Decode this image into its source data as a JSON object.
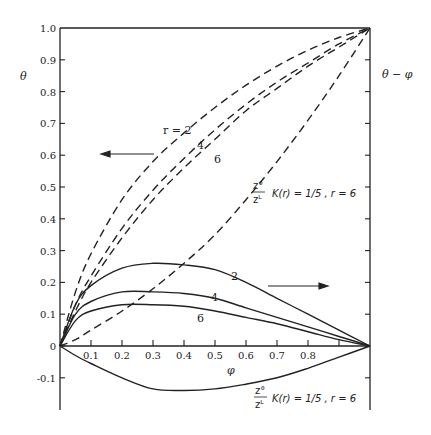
{
  "chart_data": {
    "type": "line",
    "title": "",
    "xlabel": "φ",
    "ylabel_left": "θ",
    "ylabel_right": "θ − φ",
    "xlim": [
      0,
      1.0
    ],
    "ylim_left": [
      -0.2,
      1.0
    ],
    "ylim_right": [
      -0.2,
      1.0
    ],
    "grid": false,
    "x_ticks": [
      "0.1",
      "0.2",
      "0.3",
      "0.4",
      "0.5",
      "0.6",
      "0.7",
      "0.8"
    ],
    "y_ticks": [
      "1.0",
      "0.9",
      "0.8",
      "0.7",
      "0.6",
      "0.5",
      "0.4",
      "0.3",
      "0.2",
      "0.1",
      "0",
      "-0.1"
    ],
    "x": [
      0,
      0.05,
      0.1,
      0.2,
      0.3,
      0.4,
      0.5,
      0.6,
      0.7,
      0.8,
      0.9,
      1.0
    ],
    "series": [
      {
        "name": "θ, r = 2",
        "axis": "left",
        "style": "dashed",
        "values": [
          0,
          0.17,
          0.29,
          0.46,
          0.58,
          0.67,
          0.75,
          0.82,
          0.88,
          0.93,
          0.97,
          1.0
        ]
      },
      {
        "name": "θ, r = 4",
        "axis": "left",
        "style": "dashed",
        "values": [
          0,
          0.13,
          0.22,
          0.37,
          0.49,
          0.59,
          0.68,
          0.76,
          0.83,
          0.89,
          0.95,
          1.0
        ]
      },
      {
        "name": "θ, r = 6",
        "axis": "left",
        "style": "dashed",
        "values": [
          0,
          0.11,
          0.2,
          0.34,
          0.46,
          0.56,
          0.65,
          0.74,
          0.81,
          0.88,
          0.94,
          1.0
        ]
      },
      {
        "name": "θ, (z°/zᴸ) K(r) = 1/5, r = 6",
        "axis": "left",
        "style": "dashed",
        "values": [
          0,
          0.02,
          0.05,
          0.11,
          0.18,
          0.26,
          0.35,
          0.46,
          0.58,
          0.71,
          0.85,
          1.0
        ]
      },
      {
        "name": "θ − φ, r = 2",
        "axis": "right",
        "style": "solid",
        "values": [
          0,
          0.13,
          0.19,
          0.245,
          0.26,
          0.255,
          0.24,
          0.2,
          0.15,
          0.1,
          0.05,
          0
        ]
      },
      {
        "name": "θ − φ, r = 4",
        "axis": "right",
        "style": "solid",
        "values": [
          0,
          0.1,
          0.14,
          0.17,
          0.17,
          0.165,
          0.15,
          0.12,
          0.09,
          0.06,
          0.03,
          0
        ]
      },
      {
        "name": "θ − φ, r = 6",
        "axis": "right",
        "style": "solid",
        "values": [
          0,
          0.08,
          0.11,
          0.13,
          0.13,
          0.125,
          0.11,
          0.09,
          0.07,
          0.045,
          0.02,
          0
        ]
      },
      {
        "name": "θ − φ, (z°/zᴸ) K(r) = 1/5, r = 6",
        "axis": "right",
        "style": "solid",
        "values": [
          0,
          -0.03,
          -0.055,
          -0.1,
          -0.135,
          -0.14,
          -0.135,
          -0.12,
          -0.1,
          -0.07,
          -0.035,
          0
        ]
      }
    ],
    "annotations": {
      "r2_dashed": "r = 2",
      "r4_dashed": "4",
      "r6_dashed": "6",
      "r2_solid": "2",
      "r4_solid": "4",
      "r6_solid": "6",
      "k_label_frac_num": "z°",
      "k_label_frac_den": "zᴸ",
      "k_label_text": "K(r) = 1/5 , r = 6",
      "left_arrow": "points to left axis (θ)",
      "right_arrow": "points to right axis (θ − φ)"
    },
    "legend": "none (inline curve labels)"
  }
}
